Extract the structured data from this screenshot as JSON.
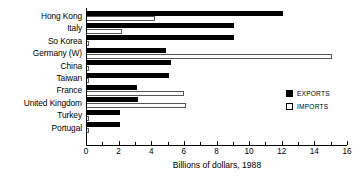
{
  "chart_data": {
    "type": "bar",
    "orientation": "horizontal",
    "title": "",
    "xlabel": "Billions of dollars, 1988",
    "ylabel": "",
    "xlim": [
      0,
      16
    ],
    "xticks": [
      0,
      2,
      4,
      6,
      8,
      10,
      12,
      14,
      16
    ],
    "xtick_labels": [
      "0",
      "2",
      "4",
      "6",
      "8",
      "10",
      "12",
      "14",
      "16"
    ],
    "minor_xticks": [
      1,
      3,
      5,
      7,
      9,
      11,
      13,
      15
    ],
    "grid": false,
    "legend_position": "right",
    "categories": [
      "Hong Kong",
      "Italy",
      "So Korea",
      "Germany (W)",
      "China",
      "Taiwan",
      "France",
      "United Kingdom",
      "Turkey",
      "Portugal"
    ],
    "series": [
      {
        "name": "EXPORTS",
        "color": "#000000",
        "values": [
          12.1,
          9.1,
          9.1,
          4.9,
          5.2,
          5.1,
          3.1,
          3.2,
          2.1,
          2.1
        ]
      },
      {
        "name": "IMPORTS",
        "color": "#ffffff",
        "values": [
          4.2,
          2.2,
          0.2,
          15.1,
          0.2,
          0.2,
          6.0,
          6.1,
          0.15,
          0.15
        ]
      }
    ]
  },
  "legend": {
    "items": [
      {
        "label": "EXPORTS",
        "swatch": "filled"
      },
      {
        "label": "IMPORTS",
        "swatch": "hollow"
      }
    ]
  }
}
